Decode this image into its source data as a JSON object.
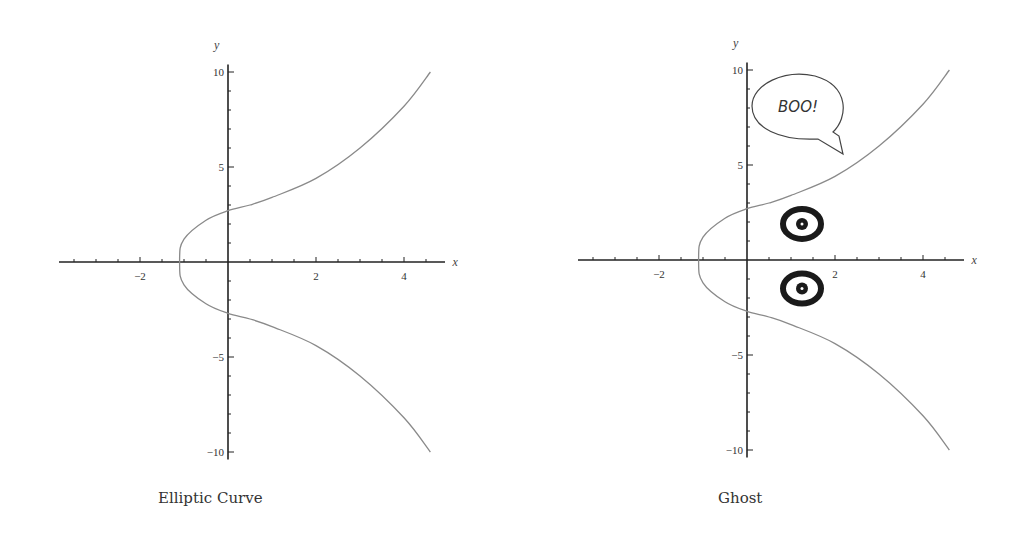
{
  "chart_data": [
    {
      "type": "line",
      "title": "Elliptic Curve",
      "xlabel": "x",
      "ylabel": "y",
      "xlim": [
        -3.8,
        4.9
      ],
      "ylim": [
        -10.5,
        10.5
      ],
      "x_ticks": [
        -2,
        2,
        4
      ],
      "y_ticks": [
        10,
        5,
        -5,
        -10
      ],
      "grid": false,
      "series": [
        {
          "name": "elliptic curve (upper branch)",
          "x": [
            -1.1,
            -1.0,
            -0.5,
            0,
            0.5,
            1,
            2,
            3,
            4,
            4.6
          ],
          "y": [
            0,
            1.2,
            2.2,
            2.7,
            3.0,
            3.4,
            4.4,
            6.0,
            8.2,
            10
          ]
        },
        {
          "name": "elliptic curve (lower branch)",
          "x": [
            -1.1,
            -1.0,
            -0.5,
            0,
            0.5,
            1,
            2,
            3,
            4,
            4.6
          ],
          "y": [
            0,
            -1.2,
            -2.2,
            -2.7,
            -3.0,
            -3.4,
            -4.4,
            -6.0,
            -8.2,
            -10
          ]
        }
      ]
    },
    {
      "type": "line",
      "title": "Ghost",
      "xlabel": "x",
      "ylabel": "y",
      "xlim": [
        -3.8,
        4.9
      ],
      "ylim": [
        -10.5,
        10.5
      ],
      "x_ticks": [
        -2,
        2,
        4
      ],
      "y_ticks": [
        10,
        5,
        -5,
        -10
      ],
      "grid": false,
      "series": [
        {
          "name": "elliptic curve (upper branch)",
          "x": [
            -1.1,
            -1.0,
            -0.5,
            0,
            0.5,
            1,
            2,
            3,
            4,
            4.6
          ],
          "y": [
            0,
            1.2,
            2.2,
            2.7,
            3.0,
            3.4,
            4.4,
            6.0,
            8.2,
            10
          ]
        },
        {
          "name": "elliptic curve (lower branch)",
          "x": [
            -1.1,
            -1.0,
            -0.5,
            0,
            0.5,
            1,
            2,
            3,
            4,
            4.6
          ],
          "y": [
            0,
            -1.2,
            -2.2,
            -2.7,
            -3.0,
            -3.4,
            -4.4,
            -6.0,
            -8.2,
            -10
          ]
        }
      ],
      "annotations": [
        {
          "type": "speech-bubble",
          "text": "BOO!",
          "x": 1.2,
          "y": 8.3
        },
        {
          "type": "eye",
          "x": 1.25,
          "y": 1.9
        },
        {
          "type": "eye",
          "x": 1.25,
          "y": -1.5
        }
      ]
    }
  ],
  "charts": {
    "left": {
      "caption": "Elliptic Curve",
      "xlabel": "x",
      "ylabel": "y",
      "tick_labels": {
        "x": [
          "−2",
          "2",
          "4"
        ],
        "y": [
          "10",
          "5",
          "−5",
          "−10"
        ]
      }
    },
    "right": {
      "caption": "Ghost",
      "xlabel": "x",
      "ylabel": "y",
      "bubble_text": "BOO!",
      "tick_labels": {
        "x": [
          "−2",
          "2",
          "4"
        ],
        "y": [
          "10",
          "5",
          "−5",
          "−10"
        ]
      }
    }
  },
  "colors": {
    "axis": "#222222",
    "curve": "#8a8a8a",
    "eye": "#1a1a1a",
    "text": "#333333"
  }
}
